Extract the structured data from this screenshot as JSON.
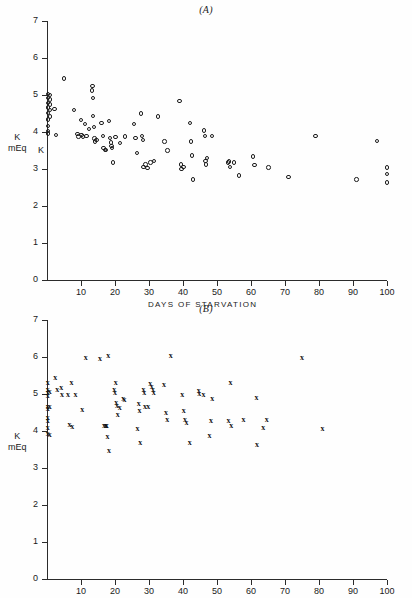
{
  "figure": {
    "panels": [
      {
        "id": "A",
        "title": "(A)",
        "y_axis_label_line1": "K",
        "y_axis_label_line2": "mEq",
        "y_axis_label_extra": "K",
        "x_axis_label": "DAYS  OF  STARVATION"
      },
      {
        "id": "B",
        "title": "(B)",
        "y_axis_label_line1": "K",
        "y_axis_label_line2": "mEq",
        "y_axis_label_extra": "",
        "x_axis_label": "DAYS  OF  STARVATION"
      }
    ],
    "y_ticks": [
      "0",
      "1",
      "2",
      "3",
      "4",
      "5",
      "6",
      "7"
    ],
    "x_ticks": [
      "10",
      "20",
      "30",
      "40",
      "50",
      "60",
      "70",
      "80",
      "90",
      "100"
    ]
  },
  "chart_data": [
    {
      "type": "scatter",
      "title": "(A)",
      "xlabel": "DAYS OF STARVATION",
      "ylabel": "K mEq",
      "xlim": [
        0,
        100
      ],
      "ylim": [
        0,
        7
      ],
      "grid": false,
      "legend": "none",
      "marker": "open-circle",
      "points": [
        [
          0.3,
          5.02
        ],
        [
          0.3,
          4.92
        ],
        [
          0.3,
          4.78
        ],
        [
          0.3,
          4.66
        ],
        [
          0.3,
          4.52
        ],
        [
          0.3,
          4.34
        ],
        [
          0.3,
          4.16
        ],
        [
          0.3,
          4.02
        ],
        [
          0.3,
          3.96
        ],
        [
          0.9,
          5.0
        ],
        [
          0.9,
          4.88
        ],
        [
          0.9,
          4.74
        ],
        [
          0.9,
          4.6
        ],
        [
          0.9,
          4.42
        ],
        [
          2.2,
          4.62
        ],
        [
          2.6,
          3.92
        ],
        [
          5.0,
          5.45
        ],
        [
          8.0,
          4.6
        ],
        [
          9.0,
          3.95
        ],
        [
          9.3,
          3.88
        ],
        [
          10.0,
          4.32
        ],
        [
          10.2,
          3.92
        ],
        [
          10.6,
          3.88
        ],
        [
          11.2,
          4.22
        ],
        [
          11.6,
          3.9
        ],
        [
          12.4,
          4.08
        ],
        [
          13.2,
          5.12
        ],
        [
          13.4,
          5.25
        ],
        [
          13.6,
          4.92
        ],
        [
          13.6,
          4.44
        ],
        [
          13.8,
          4.14
        ],
        [
          14.0,
          3.82
        ],
        [
          14.2,
          3.74
        ],
        [
          14.6,
          3.78
        ],
        [
          16.0,
          4.24
        ],
        [
          16.4,
          3.9
        ],
        [
          16.6,
          3.56
        ],
        [
          17.0,
          3.52
        ],
        [
          17.4,
          3.52
        ],
        [
          18.2,
          4.3
        ],
        [
          18.6,
          3.84
        ],
        [
          18.8,
          3.72
        ],
        [
          19.0,
          3.62
        ],
        [
          19.2,
          3.56
        ],
        [
          19.4,
          3.18
        ],
        [
          20.2,
          3.86
        ],
        [
          21.4,
          3.7
        ],
        [
          23.0,
          3.88
        ],
        [
          25.6,
          4.22
        ],
        [
          26.0,
          3.84
        ],
        [
          26.4,
          3.44
        ],
        [
          27.6,
          4.5
        ],
        [
          28.0,
          3.9
        ],
        [
          28.2,
          3.78
        ],
        [
          28.4,
          3.06
        ],
        [
          29.0,
          3.12
        ],
        [
          29.6,
          3.02
        ],
        [
          30.4,
          3.18
        ],
        [
          31.4,
          3.22
        ],
        [
          32.6,
          4.42
        ],
        [
          34.6,
          3.74
        ],
        [
          35.4,
          3.5
        ],
        [
          39.0,
          4.84
        ],
        [
          39.4,
          3.12
        ],
        [
          39.6,
          3.0
        ],
        [
          40.2,
          3.06
        ],
        [
          42.0,
          4.24
        ],
        [
          42.4,
          3.74
        ],
        [
          42.6,
          3.36
        ],
        [
          43.0,
          2.72
        ],
        [
          46.2,
          4.04
        ],
        [
          46.4,
          3.9
        ],
        [
          46.6,
          3.22
        ],
        [
          46.8,
          3.12
        ],
        [
          47.0,
          3.3
        ],
        [
          48.6,
          3.9
        ],
        [
          53.2,
          3.18
        ],
        [
          53.6,
          3.2
        ],
        [
          53.8,
          3.06
        ],
        [
          55.0,
          3.18
        ],
        [
          56.4,
          2.82
        ],
        [
          60.6,
          3.34
        ],
        [
          61.0,
          3.1
        ],
        [
          65.2,
          3.04
        ],
        [
          71.0,
          2.78
        ],
        [
          79.0,
          3.9
        ],
        [
          91.0,
          2.72
        ],
        [
          97.0,
          3.76
        ],
        [
          100.0,
          3.04
        ],
        [
          100.0,
          2.86
        ],
        [
          100.0,
          2.64
        ]
      ]
    },
    {
      "type": "scatter",
      "title": "(B)",
      "xlabel": "DAYS OF STARVATION",
      "ylabel": "K mEq",
      "xlim": [
        0,
        100
      ],
      "ylim": [
        0,
        7
      ],
      "grid": false,
      "legend": "none",
      "marker": "x",
      "points": [
        [
          0.2,
          5.3
        ],
        [
          0.2,
          5.12
        ],
        [
          0.2,
          5.02
        ],
        [
          0.2,
          4.94
        ],
        [
          0.2,
          4.66
        ],
        [
          0.2,
          4.6
        ],
        [
          0.2,
          4.36
        ],
        [
          0.2,
          4.26
        ],
        [
          0.2,
          4.08
        ],
        [
          0.2,
          3.92
        ],
        [
          0.8,
          5.06
        ],
        [
          0.8,
          4.64
        ],
        [
          0.8,
          3.88
        ],
        [
          2.4,
          5.42
        ],
        [
          3.0,
          5.12
        ],
        [
          4.2,
          5.16
        ],
        [
          4.4,
          4.98
        ],
        [
          6.2,
          4.98
        ],
        [
          6.6,
          4.16
        ],
        [
          7.2,
          5.3
        ],
        [
          7.4,
          4.1
        ],
        [
          8.4,
          4.96
        ],
        [
          10.4,
          4.56
        ],
        [
          11.4,
          5.96
        ],
        [
          15.6,
          5.94
        ],
        [
          16.8,
          4.14
        ],
        [
          17.2,
          4.14
        ],
        [
          17.4,
          4.14
        ],
        [
          17.6,
          4.14
        ],
        [
          17.8,
          3.84
        ],
        [
          18.0,
          6.02
        ],
        [
          18.2,
          3.46
        ],
        [
          19.8,
          5.12
        ],
        [
          20.0,
          5.02
        ],
        [
          20.2,
          5.3
        ],
        [
          20.4,
          4.76
        ],
        [
          20.6,
          4.68
        ],
        [
          20.8,
          4.42
        ],
        [
          21.4,
          4.62
        ],
        [
          22.4,
          4.86
        ],
        [
          22.8,
          4.84
        ],
        [
          26.6,
          4.06
        ],
        [
          27.0,
          4.74
        ],
        [
          27.2,
          4.54
        ],
        [
          27.4,
          3.68
        ],
        [
          28.4,
          5.1
        ],
        [
          28.6,
          5.02
        ],
        [
          28.8,
          4.64
        ],
        [
          29.8,
          4.66
        ],
        [
          30.4,
          5.26
        ],
        [
          30.8,
          5.18
        ],
        [
          31.2,
          5.1
        ],
        [
          31.4,
          5.04
        ],
        [
          34.4,
          5.24
        ],
        [
          35.0,
          4.5
        ],
        [
          35.4,
          4.3
        ],
        [
          36.4,
          6.02
        ],
        [
          39.8,
          4.98
        ],
        [
          40.2,
          4.54
        ],
        [
          40.6,
          4.3
        ],
        [
          41.0,
          4.22
        ],
        [
          42.0,
          3.68
        ],
        [
          44.6,
          5.08
        ],
        [
          44.8,
          5.0
        ],
        [
          46.0,
          4.96
        ],
        [
          47.8,
          3.86
        ],
        [
          48.2,
          4.26
        ],
        [
          48.6,
          4.86
        ],
        [
          53.4,
          4.26
        ],
        [
          54.0,
          5.3
        ],
        [
          54.2,
          4.14
        ],
        [
          57.8,
          4.3
        ],
        [
          61.6,
          4.88
        ],
        [
          61.8,
          3.62
        ],
        [
          63.6,
          4.08
        ],
        [
          64.6,
          4.3
        ],
        [
          75.0,
          5.96
        ],
        [
          81.0,
          4.06
        ]
      ]
    }
  ]
}
